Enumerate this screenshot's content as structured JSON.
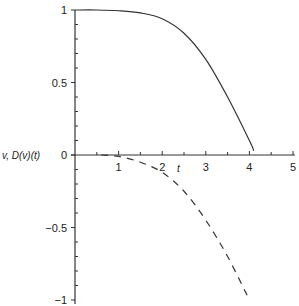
{
  "chart_data": {
    "type": "line",
    "title": "",
    "xlabel": "t",
    "ylabel": "v, D(v)(t)",
    "xlim": [
      0,
      5
    ],
    "ylim": [
      -1,
      1
    ],
    "grid": false,
    "x_ticks": [
      "1",
      "2",
      "3",
      "4",
      "5"
    ],
    "y_ticks": [
      "1",
      "0.5",
      "0",
      "−0.5",
      "−1"
    ],
    "y_tick_values": [
      1,
      0.5,
      0,
      -0.5,
      -1
    ],
    "x_tick_values": [
      1,
      2,
      3,
      4,
      5
    ],
    "series": [
      {
        "name": "v",
        "style": "solid",
        "x": [
          0,
          0.5,
          1,
          1.5,
          2,
          2.5,
          3,
          3.5,
          4,
          4.1
        ],
        "y": [
          1,
          1,
          0.995,
          0.98,
          0.94,
          0.84,
          0.66,
          0.4,
          0.1,
          0.03
        ]
      },
      {
        "name": "D(v)(t)",
        "style": "dashed",
        "x": [
          0.6,
          1,
          1.5,
          2,
          2.5,
          3,
          3.5,
          4
        ],
        "y": [
          0,
          -0.01,
          -0.05,
          -0.12,
          -0.25,
          -0.45,
          -0.7,
          -1.0
        ]
      }
    ]
  }
}
